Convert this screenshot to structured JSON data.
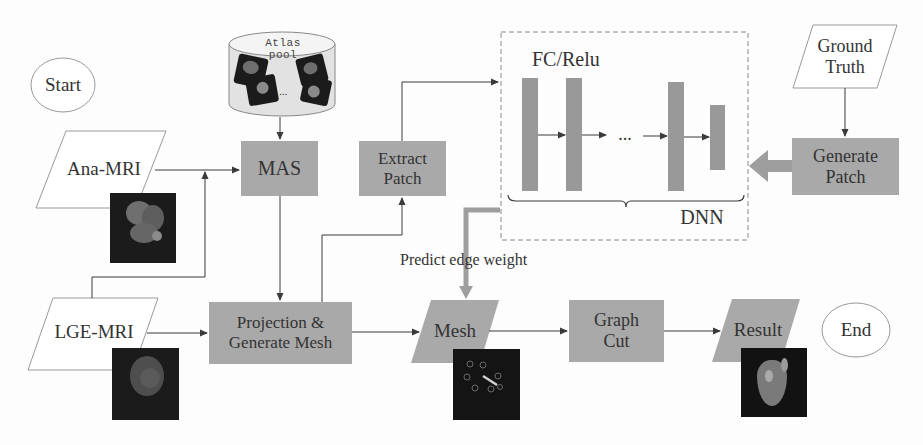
{
  "diagram": {
    "type": "flowchart",
    "colors": {
      "process_fill": "#a9a9a9",
      "io_border": "#9a9a9a",
      "arrow": "#3a3a3a",
      "thick_arrow": "#9e9e9e",
      "dnn_layer": "#999999",
      "image_bg": "#1b1b1b"
    },
    "nodes": {
      "start": {
        "label": "Start",
        "shape": "ellipse"
      },
      "end": {
        "label": "End",
        "shape": "ellipse"
      },
      "atlas_pool": {
        "label": "Atlas pool",
        "shape": "cylinder",
        "ellipsis": "..."
      },
      "ana_mri": {
        "label": "Ana-MRI",
        "shape": "parallelogram"
      },
      "lge_mri": {
        "label": "LGE-MRI",
        "shape": "parallelogram"
      },
      "mas": {
        "label": "MAS",
        "shape": "process"
      },
      "extract_patch": {
        "label_line1": "Extract",
        "label_line2": "Patch",
        "shape": "process"
      },
      "projection": {
        "label_line1": "Projection &",
        "label_line2": "Generate Mesh",
        "shape": "process"
      },
      "mesh": {
        "label": "Mesh",
        "shape": "parallelogram-filled"
      },
      "graph_cut": {
        "label_line1": "Graph",
        "label_line2": "Cut",
        "shape": "process"
      },
      "result": {
        "label": "Result",
        "shape": "parallelogram-filled"
      },
      "ground_truth": {
        "label_line1": "Ground",
        "label_line2": "Truth",
        "shape": "parallelogram"
      },
      "generate_patch": {
        "label_line1": "Generate",
        "label_line2": "Patch",
        "shape": "process"
      },
      "dnn": {
        "label": "DNN",
        "layer_label": "FC/Relu",
        "ellipsis": "...",
        "shape": "dashed-group",
        "layers": 4
      }
    },
    "edge_labels": {
      "predict_edge_weight": "Predict edge weight"
    },
    "edges": [
      {
        "from": "Atlas pool",
        "to": "MAS"
      },
      {
        "from": "Ana-MRI",
        "to": "MAS"
      },
      {
        "from": "LGE-MRI",
        "to": "MAS"
      },
      {
        "from": "MAS",
        "to": "Projection & Generate Mesh"
      },
      {
        "from": "LGE-MRI",
        "to": "Projection & Generate Mesh"
      },
      {
        "from": "Projection & Generate Mesh",
        "to": "Extract Patch"
      },
      {
        "from": "Extract Patch",
        "to": "DNN"
      },
      {
        "from": "Ground Truth",
        "to": "Generate Patch"
      },
      {
        "from": "Generate Patch",
        "to": "DNN",
        "style": "thick"
      },
      {
        "from": "DNN",
        "to": "Mesh",
        "label": "Predict edge weight",
        "style": "thick"
      },
      {
        "from": "Projection & Generate Mesh",
        "to": "Mesh"
      },
      {
        "from": "Mesh",
        "to": "Graph Cut"
      },
      {
        "from": "Graph Cut",
        "to": "Result"
      }
    ]
  }
}
